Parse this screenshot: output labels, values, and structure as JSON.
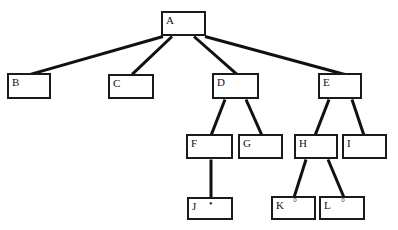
{
  "diagram": {
    "type": "tree",
    "stroke_color": "#111111",
    "nodes": [
      {
        "id": "A",
        "label": "A",
        "marker": "",
        "x": 161,
        "y": 11,
        "w": 45,
        "h": 25
      },
      {
        "id": "B",
        "label": "B",
        "marker": "",
        "x": 7,
        "y": 73,
        "w": 44,
        "h": 26
      },
      {
        "id": "C",
        "label": "C",
        "marker": "",
        "x": 108,
        "y": 74,
        "w": 46,
        "h": 25
      },
      {
        "id": "D",
        "label": "D",
        "marker": "",
        "x": 212,
        "y": 73,
        "w": 47,
        "h": 26
      },
      {
        "id": "E",
        "label": "E",
        "marker": "",
        "x": 318,
        "y": 73,
        "w": 44,
        "h": 26
      },
      {
        "id": "F",
        "label": "F",
        "marker": "",
        "x": 186,
        "y": 134,
        "w": 47,
        "h": 25
      },
      {
        "id": "G",
        "label": "G",
        "marker": "",
        "x": 238,
        "y": 134,
        "w": 45,
        "h": 25
      },
      {
        "id": "H",
        "label": "H",
        "marker": "",
        "x": 294,
        "y": 134,
        "w": 44,
        "h": 25
      },
      {
        "id": "I",
        "label": "I",
        "marker": "",
        "x": 342,
        "y": 134,
        "w": 45,
        "h": 25
      },
      {
        "id": "J",
        "label": "J",
        "marker": "•",
        "x": 187,
        "y": 197,
        "w": 46,
        "h": 23
      },
      {
        "id": "K",
        "label": "K",
        "marker": "°",
        "x": 271,
        "y": 196,
        "w": 45,
        "h": 24
      },
      {
        "id": "L",
        "label": "L",
        "marker": "°",
        "x": 319,
        "y": 196,
        "w": 46,
        "h": 24
      }
    ],
    "edges": [
      {
        "from": "A",
        "to": "B",
        "x1": 163,
        "y1": 36,
        "x2": 30,
        "y2": 74
      },
      {
        "from": "A",
        "to": "C",
        "x1": 172,
        "y1": 36,
        "x2": 132,
        "y2": 74
      },
      {
        "from": "A",
        "to": "D",
        "x1": 194,
        "y1": 36,
        "x2": 237,
        "y2": 74
      },
      {
        "from": "A",
        "to": "E",
        "x1": 205,
        "y1": 36,
        "x2": 345,
        "y2": 74
      },
      {
        "from": "D",
        "to": "F",
        "x1": 225,
        "y1": 99,
        "x2": 211,
        "y2": 135
      },
      {
        "from": "D",
        "to": "G",
        "x1": 246,
        "y1": 99,
        "x2": 262,
        "y2": 135
      },
      {
        "from": "E",
        "to": "H",
        "x1": 329,
        "y1": 99,
        "x2": 315,
        "y2": 135
      },
      {
        "from": "E",
        "to": "I",
        "x1": 352,
        "y1": 99,
        "x2": 364,
        "y2": 135
      },
      {
        "from": "F",
        "to": "J",
        "x1": 211,
        "y1": 159,
        "x2": 211,
        "y2": 198
      },
      {
        "from": "H",
        "to": "K",
        "x1": 306,
        "y1": 159,
        "x2": 294,
        "y2": 197
      },
      {
        "from": "H",
        "to": "L",
        "x1": 328,
        "y1": 159,
        "x2": 344,
        "y2": 197
      }
    ]
  }
}
